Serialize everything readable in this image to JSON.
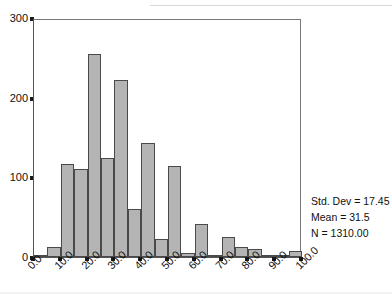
{
  "chart_data": {
    "type": "bar",
    "title": "",
    "subtitle": "",
    "xlabel": "",
    "ylabel": "",
    "xlim": [
      0,
      100
    ],
    "ylim": [
      0,
      300
    ],
    "grid": false,
    "legend": null,
    "bin_width": 5,
    "categories": [
      "0-5",
      "5-10",
      "10-15",
      "15-20",
      "20-25",
      "25-30",
      "30-35",
      "35-40",
      "40-45",
      "45-50",
      "50-55",
      "55-60",
      "60-65",
      "65-70",
      "70-75",
      "75-80",
      "80-85",
      "85-90",
      "90-95",
      "95-100"
    ],
    "bin_starts": [
      0,
      5,
      10,
      15,
      20,
      25,
      30,
      35,
      40,
      45,
      50,
      55,
      60,
      65,
      70,
      75,
      80,
      85,
      90,
      95
    ],
    "values": [
      3,
      12,
      117,
      111,
      255,
      124,
      222,
      60,
      143,
      23,
      114,
      5,
      41,
      3,
      25,
      12,
      10,
      1,
      2,
      7
    ],
    "x_tick_labels": [
      "0.0",
      "10.0",
      "20.0",
      "30.0",
      "40.0",
      "50.0",
      "60.0",
      "70.0",
      "80.0",
      "90.0",
      "100.0"
    ],
    "x_tick_values": [
      0,
      10,
      20,
      30,
      40,
      50,
      60,
      70,
      80,
      90,
      100
    ],
    "y_tick_labels": [
      "0",
      "100",
      "200",
      "300"
    ],
    "y_tick_values": [
      0,
      100,
      200,
      300
    ],
    "annotations": [
      "Std. Dev = 17.45",
      "Mean = 31.5",
      "N = 1310.00"
    ],
    "colors": {
      "bar_fill": "#b4b4b4",
      "bar_edge": "#4a4a4a",
      "axis": "#1a1a1a",
      "text": "#101010",
      "background": "#ffffff"
    }
  },
  "stats": {
    "std_dev": "Std. Dev = 17.45",
    "mean": "Mean = 31.5",
    "n": "N = 1310.00"
  }
}
